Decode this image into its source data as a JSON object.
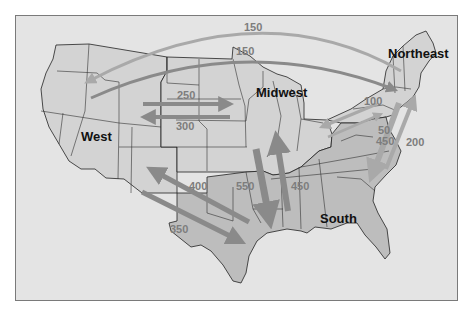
{
  "map": {
    "title": "",
    "colors": {
      "background": "#e4e4e4",
      "land_west_midwest_northeast": "#d3d3d3",
      "land_south": "#bdbdbd",
      "state_border": "#222222",
      "arrow_dark": "#8a8a8a",
      "arrow_light": "#a9a9a9",
      "label_flow": "#7d7d7d",
      "label_region": "#111111"
    },
    "regions": [
      {
        "name": "West",
        "label": "West"
      },
      {
        "name": "Midwest",
        "label": "Midwest"
      },
      {
        "name": "Northeast",
        "label": "Northeast"
      },
      {
        "name": "South",
        "label": "South"
      }
    ],
    "flows": [
      {
        "from": "Northeast",
        "to": "West",
        "value": "150",
        "label": "150",
        "style": "light-arc-top"
      },
      {
        "from": "West",
        "to": "Northeast",
        "value": "150",
        "label": "150",
        "style": "dark-arc"
      },
      {
        "from": "West",
        "to": "Midwest",
        "value": "250",
        "label": "250"
      },
      {
        "from": "Midwest",
        "to": "West",
        "value": "300",
        "label": "300"
      },
      {
        "from": "Northeast",
        "to": "Midwest",
        "value": "100",
        "label": "100"
      },
      {
        "from": "Midwest",
        "to": "Northeast",
        "value": "50",
        "label": "50"
      },
      {
        "from": "Northeast",
        "to": "South",
        "value": "450",
        "label": "450"
      },
      {
        "from": "South",
        "to": "Northeast",
        "value": "200",
        "label": "200"
      },
      {
        "from": "South",
        "to": "West",
        "value": "400",
        "label": "400"
      },
      {
        "from": "West",
        "to": "South",
        "value": "350",
        "label": "350"
      },
      {
        "from": "Midwest",
        "to": "South",
        "value": "550",
        "label": "550"
      },
      {
        "from": "South",
        "to": "Midwest",
        "value": "450",
        "label": "450"
      }
    ]
  }
}
